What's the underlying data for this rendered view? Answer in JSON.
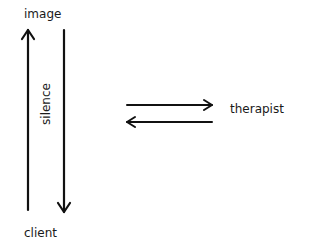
{
  "diagram": {
    "nodes": {
      "image": "image",
      "client": "client",
      "therapist": "therapist"
    },
    "edge_labels": {
      "silence": "silence"
    },
    "edges": [
      {
        "from": "client",
        "to": "image",
        "direction": "up"
      },
      {
        "from": "image",
        "to": "client",
        "direction": "down",
        "label": "silence"
      },
      {
        "from": "center",
        "to": "therapist",
        "direction": "right"
      },
      {
        "from": "therapist",
        "to": "center",
        "direction": "left"
      }
    ],
    "colors": {
      "stroke": "#111111",
      "background": "#ffffff",
      "text": "#1a1a1a"
    }
  }
}
